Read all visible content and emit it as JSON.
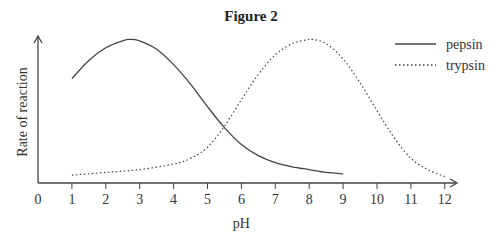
{
  "chart_data": {
    "type": "line",
    "title": "Figure 2",
    "xlabel": "pH",
    "ylabel": "Rate of reaction",
    "x_ticks": [
      "0",
      "1",
      "2",
      "3",
      "4",
      "5",
      "6",
      "7",
      "8",
      "9",
      "10",
      "11",
      "12"
    ],
    "xlim": [
      0,
      12.3
    ],
    "y_ticks": [],
    "grid": false,
    "legend_position": "top-right",
    "series": [
      {
        "name": "pepsin",
        "style": "solid",
        "x": [
          1,
          1.5,
          2,
          2.5,
          2.7,
          3,
          3.5,
          4,
          4.5,
          5,
          5.5,
          6,
          6.5,
          7,
          7.5,
          8,
          8.5,
          9
        ],
        "y": [
          71,
          84,
          93,
          98,
          99,
          98,
          92,
          81,
          67,
          51,
          36,
          24,
          16,
          11,
          8,
          6,
          4,
          3
        ]
      },
      {
        "name": "trypsin",
        "style": "dotted",
        "x": [
          1,
          2,
          3,
          4,
          4.5,
          5,
          5.5,
          6,
          6.5,
          7,
          7.5,
          8,
          8.1,
          8.5,
          9,
          9.5,
          10,
          10.5,
          11,
          11.5,
          12
        ],
        "y": [
          2,
          4,
          6,
          10,
          14,
          22,
          37,
          56,
          74,
          88,
          96,
          99,
          99,
          96,
          85,
          68,
          48,
          29,
          14,
          6,
          1
        ]
      }
    ]
  }
}
